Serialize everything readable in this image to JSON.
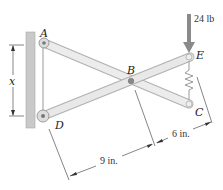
{
  "diagram": {
    "type": "scissor-linkage-mechanics",
    "points": {
      "A": "A",
      "B": "B",
      "C": "C",
      "D": "D",
      "E": "E"
    },
    "force_label": "24 lb",
    "dimension_x": "x",
    "dimension_9": "9 in.",
    "dimension_6": "6 in.",
    "colors": {
      "bar_fill": "#e6e6e6",
      "bar_stroke": "#b0b0b0",
      "wall": "#c8c8c8",
      "arrow": "#808080",
      "dim_line": "#333333"
    }
  }
}
